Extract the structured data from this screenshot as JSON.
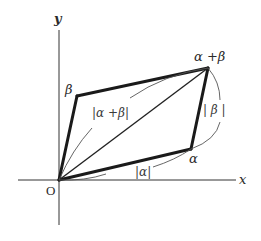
{
  "diagram": {
    "axes": {
      "x_label": "x",
      "y_label": "y",
      "origin_label": "O"
    },
    "vertices": {
      "alpha": "α",
      "beta": "β",
      "alpha_plus_beta": "α +β"
    },
    "magnitudes": {
      "abs_alpha": "|α|",
      "abs_beta": "| β |",
      "abs_alpha_plus_beta": "|α +β|"
    },
    "colors": {
      "thick_line": "#1a1a1a",
      "thin_line": "#555555",
      "axis": "#333333",
      "background": "#ffffff"
    },
    "points": {
      "O": [
        59,
        180
      ],
      "alpha": [
        191,
        149
      ],
      "beta": [
        77,
        96
      ],
      "alpha_plus_beta": [
        208,
        68
      ]
    }
  }
}
